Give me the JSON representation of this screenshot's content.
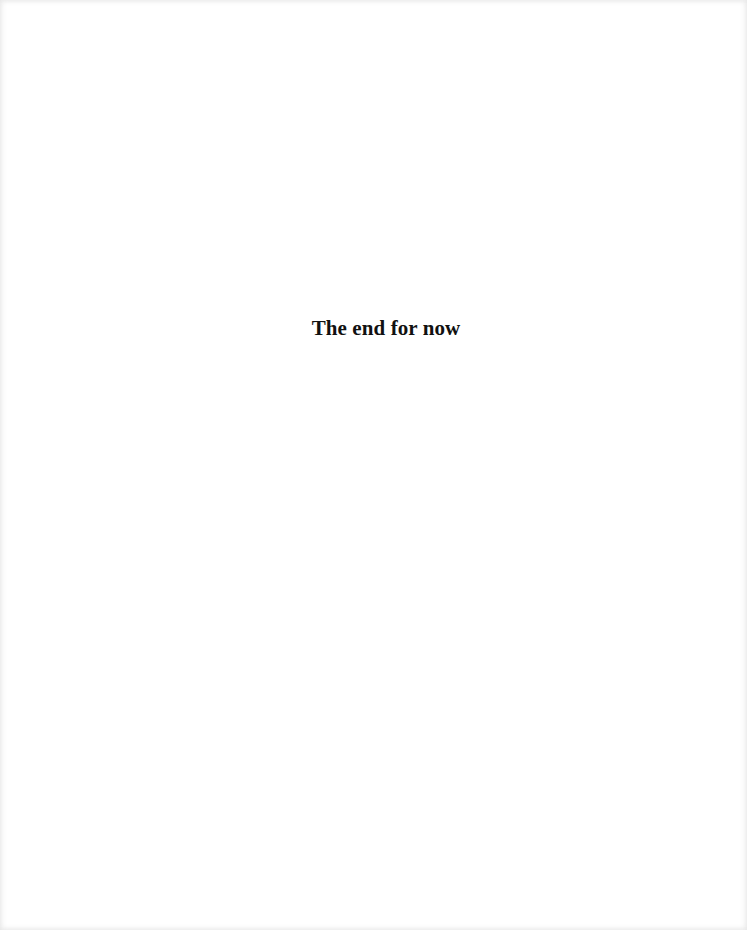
{
  "document": {
    "heading": "The end for now"
  }
}
